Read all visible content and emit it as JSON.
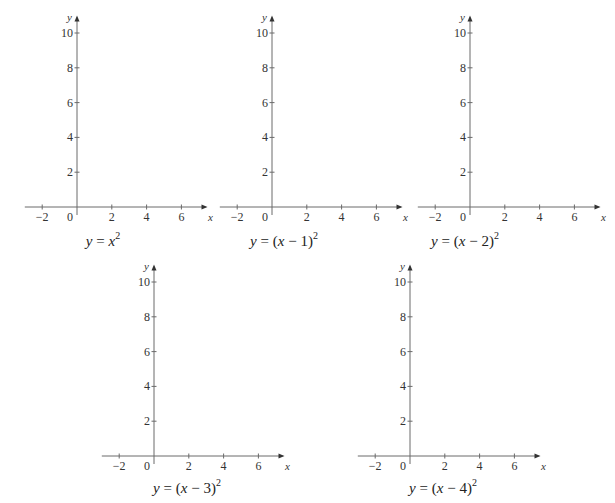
{
  "worksheet": {
    "description": "Blank coordinate axes for sketching translated parabolas",
    "graphs": [
      {
        "id": "g1",
        "caption": "y = x²",
        "caption_parts": [
          "y",
          " = ",
          "x",
          "2",
          ""
        ],
        "origin": [
          77,
          207
        ],
        "caption_pos": [
          103,
          246
        ]
      },
      {
        "id": "g2",
        "caption": "y = (x − 1)²",
        "caption_parts": [
          "y",
          " = (",
          "x",
          " − 1)",
          "2"
        ],
        "origin": [
          272,
          207
        ],
        "caption_pos": [
          284,
          246
        ]
      },
      {
        "id": "g3",
        "caption": "y = (x − 2)²",
        "caption_parts": [
          "y",
          " = (",
          "x",
          " − 2)",
          "2"
        ],
        "origin": [
          470,
          207
        ],
        "caption_pos": [
          465,
          246
        ]
      },
      {
        "id": "g4",
        "caption": "y = (x − 3)²",
        "caption_parts": [
          "y",
          " = (",
          "x",
          " − 3)",
          "2"
        ],
        "origin": [
          154,
          456
        ],
        "caption_pos": [
          187,
          493
        ]
      },
      {
        "id": "g5",
        "caption": "y = (x − 4)²",
        "caption_parts": [
          "y",
          " = (",
          "x",
          " − 4)",
          "2"
        ],
        "origin": [
          410,
          456
        ],
        "caption_pos": [
          443,
          493
        ]
      }
    ],
    "axes": {
      "x_label": "x",
      "y_label": "y",
      "origin_label": "0",
      "x_ticks": [
        -2,
        2,
        4,
        6
      ],
      "y_ticks": [
        2,
        4,
        6,
        8,
        10
      ],
      "x_range": [
        -3,
        7.5
      ],
      "y_range": [
        0,
        11
      ],
      "unit_px": 17.4
    },
    "colors": {
      "axis": "#6a6a6a",
      "text": "#222222",
      "background": "#ffffff"
    }
  },
  "chart_data": [
    {
      "type": "line",
      "title": "y = x^2",
      "xlabel": "x",
      "ylabel": "y",
      "xlim": [
        -3,
        7
      ],
      "ylim": [
        0,
        10.5
      ],
      "x_ticks": [
        -2,
        0,
        2,
        4,
        6
      ],
      "y_ticks": [
        2,
        4,
        6,
        8,
        10
      ],
      "grid": false,
      "series": []
    },
    {
      "type": "line",
      "title": "y = (x - 1)^2",
      "xlabel": "x",
      "ylabel": "y",
      "xlim": [
        -3,
        7
      ],
      "ylim": [
        0,
        10.5
      ],
      "x_ticks": [
        -2,
        0,
        2,
        4,
        6
      ],
      "y_ticks": [
        2,
        4,
        6,
        8,
        10
      ],
      "grid": false,
      "series": []
    },
    {
      "type": "line",
      "title": "y = (x - 2)^2",
      "xlabel": "x",
      "ylabel": "y",
      "xlim": [
        -3,
        7
      ],
      "ylim": [
        0,
        10.5
      ],
      "x_ticks": [
        -2,
        0,
        2,
        4,
        6
      ],
      "y_ticks": [
        2,
        4,
        6,
        8,
        10
      ],
      "grid": false,
      "series": []
    },
    {
      "type": "line",
      "title": "y = (x - 3)^2",
      "xlabel": "x",
      "ylabel": "y",
      "xlim": [
        -3,
        7
      ],
      "ylim": [
        0,
        10.5
      ],
      "x_ticks": [
        -2,
        0,
        2,
        4,
        6
      ],
      "y_ticks": [
        2,
        4,
        6,
        8,
        10
      ],
      "grid": false,
      "series": []
    },
    {
      "type": "line",
      "title": "y = (x - 4)^2",
      "xlabel": "x",
      "ylabel": "y",
      "xlim": [
        -3,
        7
      ],
      "ylim": [
        0,
        10.5
      ],
      "x_ticks": [
        -2,
        0,
        2,
        4,
        6
      ],
      "y_ticks": [
        2,
        4,
        6,
        8,
        10
      ],
      "grid": false,
      "series": []
    }
  ]
}
